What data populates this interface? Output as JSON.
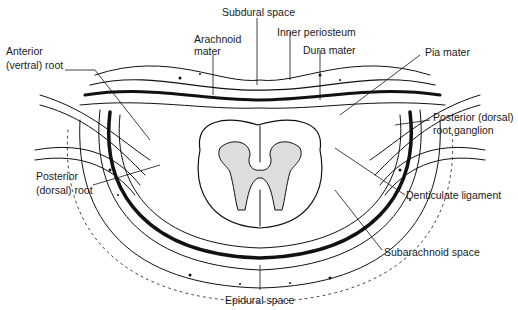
{
  "diagram": {
    "labels": {
      "subdural_space": "Subdural space",
      "inner_periosteum": "Inner periosteum",
      "dura_mater": "Dura mater",
      "arachnoid_1": "Arachnoid",
      "arachnoid_2": "mater",
      "anterior_root_1": "Anterior",
      "anterior_root_2": "(vertral) root",
      "pia_mater": "Pia mater",
      "posterior_ganglion_1": "Posterior (dorsal)",
      "posterior_ganglion_2": "root ganglion",
      "posterior_root_1": "Posterior",
      "posterior_root_2": "(dorsal) root",
      "denticulate_ligament": "Denticulate ligament",
      "subarachnoid_space": "Subarachnoid space",
      "epidural_space": "Epidural space"
    }
  }
}
